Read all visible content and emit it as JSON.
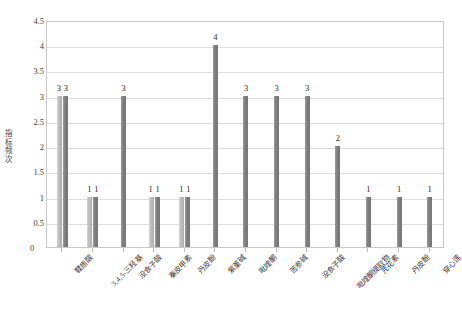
{
  "chart_data": {
    "type": "bar",
    "title": "",
    "xlabel": "",
    "ylabel": "指标频次",
    "ylim": [
      0,
      4.5
    ],
    "ytick_step": 0.5,
    "ytick_labels": [
      "4.5",
      "4",
      "3.5",
      "3",
      "2.5",
      "2",
      "1.5",
      "1",
      "0.5",
      "0"
    ],
    "ytick_values": [
      4.5,
      4,
      3.5,
      3,
      2.5,
      2,
      1.5,
      1,
      0.5,
      0
    ],
    "grid": true,
    "legend": "none",
    "series_colors": {
      "light": "#b8b8b8",
      "dark": "#808080",
      "gridline": "#dedede",
      "border": "#c9c9c9",
      "text": "#3f3f3f"
    },
    "categories": [
      "鞣质酸",
      "3,4,5-三羟基",
      "没食子酸",
      "秦皮甲素",
      "丹皮酚",
      "紫堇碱",
      "吡喹酮",
      "苦参碱",
      "没食子酸",
      "吡喹酮提取物",
      "芫花素",
      "丹皮酚",
      "穿心莲"
    ],
    "groups": [
      {
        "index": 0,
        "label": "鞣质酸",
        "bars": [
          3,
          3
        ],
        "labels": [
          "3",
          "3"
        ]
      },
      {
        "index": 1,
        "label": "3,4,5-三羟基",
        "bars": [
          1,
          1
        ],
        "labels": [
          "1",
          "1"
        ]
      },
      {
        "index": 2,
        "label": "没食子酸",
        "bars": [
          3
        ],
        "labels": [
          "3"
        ]
      },
      {
        "index": 3,
        "label": "秦皮甲素",
        "bars": [
          1,
          1
        ],
        "labels": [
          "1",
          "1"
        ]
      },
      {
        "index": 4,
        "label": "丹皮酚",
        "bars": [
          1,
          1
        ],
        "labels": [
          "1",
          "1"
        ]
      },
      {
        "index": 5,
        "label": "紫堇碱",
        "bars": [
          4
        ],
        "labels": [
          "4"
        ]
      },
      {
        "index": 6,
        "label": "吡喹酮",
        "bars": [
          3
        ],
        "labels": [
          "3"
        ]
      },
      {
        "index": 7,
        "label": "苦参碱",
        "bars": [
          3
        ],
        "labels": [
          "3"
        ]
      },
      {
        "index": 8,
        "label": "没食子酸",
        "bars": [
          3
        ],
        "labels": [
          "3"
        ]
      },
      {
        "index": 9,
        "label": "吡喹酮提取物",
        "bars": [
          2
        ],
        "labels": [
          "2"
        ]
      },
      {
        "index": 10,
        "label": "芫花素",
        "bars": [
          1
        ],
        "labels": [
          "1"
        ]
      },
      {
        "index": 11,
        "label": "丹皮酚",
        "bars": [
          1
        ],
        "labels": [
          "1"
        ]
      },
      {
        "index": 12,
        "label": "穿心莲",
        "bars": [
          1
        ],
        "labels": [
          "1"
        ]
      }
    ],
    "values_flat": [
      3,
      3,
      1,
      1,
      3,
      1,
      1,
      1,
      1,
      4,
      3,
      3,
      3,
      2,
      1,
      1
    ],
    "zero_label": "0"
  }
}
